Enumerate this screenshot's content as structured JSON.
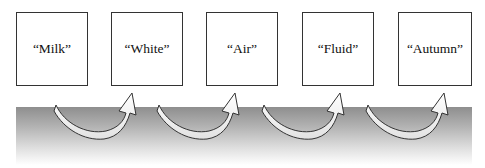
{
  "diagram": {
    "type": "sequence",
    "boxes": [
      {
        "label": "“Milk”"
      },
      {
        "label": "“White”"
      },
      {
        "label": "“Air”"
      },
      {
        "label": "“Fluid”"
      },
      {
        "label": "“Autumn”"
      }
    ],
    "arrows": [
      {
        "from": "“Milk”",
        "to": "“White”"
      },
      {
        "from": "“White”",
        "to": "“Air”"
      },
      {
        "from": "“Air”",
        "to": "“Fluid”"
      },
      {
        "from": "“Fluid”",
        "to": "“Autumn”"
      }
    ],
    "colors": {
      "band_top": "#8e8e8e",
      "band_bottom": "#ffffff",
      "arrow_fill": "#f2f2f2",
      "border": "#333333"
    }
  }
}
